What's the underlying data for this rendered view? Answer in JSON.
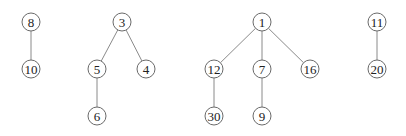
{
  "diagram": {
    "type": "forest",
    "node_radius": 9,
    "colors": {
      "edge": "#8a8a8a",
      "node_stroke": "#6a6a6a",
      "node_fill": "#ffffff",
      "text": "#222222"
    },
    "trees": [
      {
        "root": "8",
        "nodes": [
          {
            "id": "8",
            "label": "8",
            "x": 31,
            "y": 22
          },
          {
            "id": "10",
            "label": "10",
            "x": 31,
            "y": 69
          }
        ],
        "edges": [
          [
            "8",
            "10"
          ]
        ]
      },
      {
        "root": "3",
        "nodes": [
          {
            "id": "3",
            "label": "3",
            "x": 122,
            "y": 22
          },
          {
            "id": "5",
            "label": "5",
            "x": 97,
            "y": 69
          },
          {
            "id": "4",
            "label": "4",
            "x": 146,
            "y": 69
          },
          {
            "id": "6",
            "label": "6",
            "x": 97,
            "y": 116
          }
        ],
        "edges": [
          [
            "3",
            "5"
          ],
          [
            "3",
            "4"
          ],
          [
            "5",
            "6"
          ]
        ]
      },
      {
        "root": "1",
        "nodes": [
          {
            "id": "1",
            "label": "1",
            "x": 262,
            "y": 22
          },
          {
            "id": "12",
            "label": "12",
            "x": 214,
            "y": 69
          },
          {
            "id": "7",
            "label": "7",
            "x": 262,
            "y": 69
          },
          {
            "id": "16",
            "label": "16",
            "x": 310,
            "y": 69
          },
          {
            "id": "30",
            "label": "30",
            "x": 214,
            "y": 116
          },
          {
            "id": "9",
            "label": "9",
            "x": 262,
            "y": 116
          }
        ],
        "edges": [
          [
            "1",
            "12"
          ],
          [
            "1",
            "7"
          ],
          [
            "1",
            "16"
          ],
          [
            "12",
            "30"
          ],
          [
            "7",
            "9"
          ]
        ]
      },
      {
        "root": "11",
        "nodes": [
          {
            "id": "11",
            "label": "11",
            "x": 377,
            "y": 22
          },
          {
            "id": "20",
            "label": "20",
            "x": 377,
            "y": 69
          }
        ],
        "edges": [
          [
            "11",
            "20"
          ]
        ]
      }
    ]
  }
}
